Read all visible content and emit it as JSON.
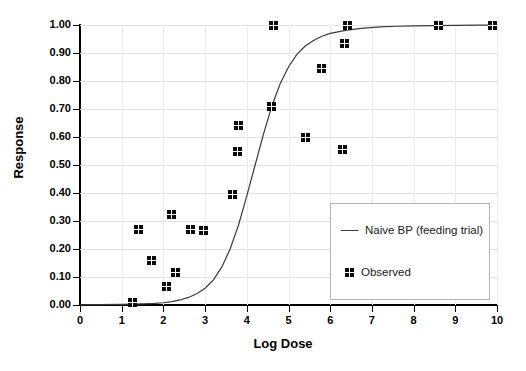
{
  "chart_data": {
    "type": "scatter",
    "title": "",
    "xlabel": "Log Dose",
    "ylabel": "Response",
    "xlim": [
      0,
      10
    ],
    "ylim": [
      0.0,
      1.0
    ],
    "grid": true,
    "legend_position": "bottom-right",
    "x_ticks": [
      "0",
      "1",
      "2",
      "3",
      "4",
      "5",
      "6",
      "7",
      "8",
      "9",
      "10"
    ],
    "x_tick_values": [
      0,
      1,
      2,
      3,
      4,
      5,
      6,
      7,
      8,
      9,
      10
    ],
    "y_ticks": [
      "0.00",
      "0.10",
      "0.20",
      "0.30",
      "0.40",
      "0.50",
      "0.60",
      "0.70",
      "0.80",
      "0.90",
      "1.00"
    ],
    "y_tick_values": [
      0.0,
      0.1,
      0.2,
      0.3,
      0.4,
      0.5,
      0.6,
      0.7,
      0.8,
      0.9,
      1.0
    ],
    "series": [
      {
        "name": "Naive BP (feeding trial)",
        "type": "line",
        "color": "#3a3a3a",
        "model": "logistic",
        "ed50": 4.35,
        "slope": 1.55,
        "x": [
          0.0,
          0.5,
          1.0,
          1.5,
          1.8,
          2.0,
          2.2,
          2.4,
          2.6,
          2.8,
          3.0,
          3.2,
          3.4,
          3.6,
          3.8,
          4.0,
          4.2,
          4.4,
          4.6,
          4.8,
          5.0,
          5.2,
          5.4,
          5.6,
          5.8,
          6.0,
          6.4,
          6.8,
          7.2,
          7.6,
          8.0,
          8.5,
          9.0,
          9.5,
          10.0
        ],
        "y": [
          0.0008,
          0.0013,
          0.002,
          0.004,
          0.006,
          0.008,
          0.012,
          0.018,
          0.027,
          0.04,
          0.06,
          0.09,
          0.135,
          0.2,
          0.285,
          0.39,
          0.5,
          0.61,
          0.71,
          0.79,
          0.85,
          0.895,
          0.925,
          0.945,
          0.96,
          0.97,
          0.982,
          0.989,
          0.993,
          0.9955,
          0.997,
          0.998,
          0.9988,
          0.9992,
          0.9995
        ]
      },
      {
        "name": "Observed",
        "type": "scatter",
        "color": "#0a0a0a",
        "points": [
          {
            "x": 1.25,
            "y": 0.01
          },
          {
            "x": 1.4,
            "y": 0.27
          },
          {
            "x": 1.72,
            "y": 0.16
          },
          {
            "x": 2.08,
            "y": 0.065
          },
          {
            "x": 2.2,
            "y": 0.325
          },
          {
            "x": 2.28,
            "y": 0.115
          },
          {
            "x": 2.65,
            "y": 0.27
          },
          {
            "x": 2.95,
            "y": 0.265
          },
          {
            "x": 3.65,
            "y": 0.395
          },
          {
            "x": 3.78,
            "y": 0.55
          },
          {
            "x": 3.8,
            "y": 0.64
          },
          {
            "x": 4.6,
            "y": 0.71
          },
          {
            "x": 4.63,
            "y": 1.0
          },
          {
            "x": 5.4,
            "y": 0.6
          },
          {
            "x": 5.8,
            "y": 0.845
          },
          {
            "x": 6.3,
            "y": 0.555
          },
          {
            "x": 6.35,
            "y": 0.935
          },
          {
            "x": 6.42,
            "y": 1.0
          },
          {
            "x": 8.6,
            "y": 1.0
          },
          {
            "x": 9.9,
            "y": 1.0
          }
        ]
      }
    ],
    "legend": [
      {
        "label": "Naive BP (feeding trial)",
        "marker": "line"
      },
      {
        "label": "Observed",
        "marker": "square"
      }
    ]
  },
  "colors": {
    "marker": "#0a0a0a",
    "curve": "#3a3a3a",
    "gridline": "#e2e2e2",
    "axis": "#000000",
    "legend_border": "#b4b4b4",
    "background": "#ffffff"
  }
}
